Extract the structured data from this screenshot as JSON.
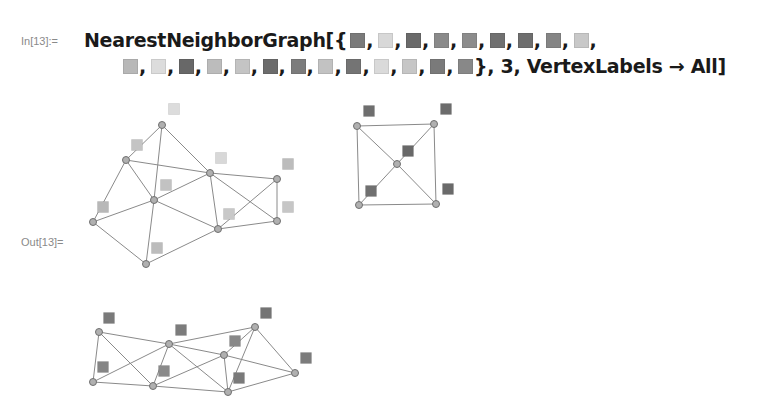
{
  "notebook": {
    "input_label": "In[13]:=",
    "output_label": "Out[13]=",
    "input": {
      "function": "NearestNeighborGraph[{",
      "swatches_row1": [
        "#7a7a7a",
        "#d8d8d8",
        "#6a6a6a",
        "#8a8a8a",
        "#8c8c8c",
        "#707070",
        "#6e6e6e",
        "#858585",
        "#c8c8c8"
      ],
      "swatches_row2": [
        "#b8b8b8",
        "#dcdcdc",
        "#686868",
        "#bcbcbc",
        "#c4c4c4",
        "#6c6c6c",
        "#7c7c7c",
        "#c2c2c2",
        "#747474",
        "#dadada",
        "#c6c6c6",
        "#7a7a7a",
        "#888888"
      ],
      "tail": "}, 3, VertexLabels → All]",
      "separator": ","
    },
    "output": {
      "graphs": [
        {
          "nodes": [
            {
              "id": "A",
              "x": 162,
              "y": 125,
              "label_color": "#dcdcdc",
              "lx": 174,
              "ly": 109
            },
            {
              "id": "B",
              "x": 126,
              "y": 160,
              "label_color": "#c4c4c4",
              "lx": 137,
              "ly": 145
            },
            {
              "id": "C",
              "x": 210,
              "y": 173,
              "label_color": "#d8d8d8",
              "lx": 221,
              "ly": 158
            },
            {
              "id": "D",
              "x": 277,
              "y": 179,
              "label_color": "#bcbcbc",
              "lx": 288,
              "ly": 164
            },
            {
              "id": "E",
              "x": 154,
              "y": 200,
              "label_color": "#c2c2c2",
              "lx": 166,
              "ly": 185
            },
            {
              "id": "F",
              "x": 93,
              "y": 222,
              "label_color": "#b8b8b8",
              "lx": 103,
              "ly": 207
            },
            {
              "id": "G",
              "x": 218,
              "y": 229,
              "label_color": "#c8c8c8",
              "lx": 229,
              "ly": 214
            },
            {
              "id": "H",
              "x": 277,
              "y": 221,
              "label_color": "#c6c6c6",
              "lx": 288,
              "ly": 207
            },
            {
              "id": "I",
              "x": 146,
              "y": 264,
              "label_color": "#bcbcbc",
              "lx": 157,
              "ly": 248
            }
          ],
          "edges": [
            [
              "A",
              "B"
            ],
            [
              "A",
              "E"
            ],
            [
              "A",
              "C"
            ],
            [
              "B",
              "C"
            ],
            [
              "B",
              "E"
            ],
            [
              "B",
              "F"
            ],
            [
              "E",
              "C"
            ],
            [
              "E",
              "F"
            ],
            [
              "E",
              "G"
            ],
            [
              "E",
              "I"
            ],
            [
              "F",
              "I"
            ],
            [
              "I",
              "G"
            ],
            [
              "C",
              "G"
            ],
            [
              "C",
              "D"
            ],
            [
              "C",
              "H"
            ],
            [
              "G",
              "D"
            ],
            [
              "G",
              "H"
            ],
            [
              "D",
              "H"
            ]
          ]
        },
        {
          "nodes": [
            {
              "id": "TL",
              "x": 357,
              "y": 126,
              "label_color": "#6e6e6e",
              "lx": 369,
              "ly": 111
            },
            {
              "id": "TR",
              "x": 434,
              "y": 124,
              "label_color": "#6c6c6c",
              "lx": 446,
              "ly": 109
            },
            {
              "id": "M",
              "x": 397,
              "y": 164,
              "label_color": "#686868",
              "lx": 408,
              "ly": 151
            },
            {
              "id": "BL",
              "x": 359,
              "y": 205,
              "label_color": "#707070",
              "lx": 371,
              "ly": 191
            },
            {
              "id": "BR",
              "x": 436,
              "y": 204,
              "label_color": "#6a6a6a",
              "lx": 448,
              "ly": 189
            }
          ],
          "edges": [
            [
              "TL",
              "TR"
            ],
            [
              "TL",
              "BL"
            ],
            [
              "TR",
              "BR"
            ],
            [
              "BL",
              "BR"
            ],
            [
              "TL",
              "M"
            ],
            [
              "TR",
              "M"
            ],
            [
              "BL",
              "M"
            ],
            [
              "BR",
              "M"
            ]
          ]
        },
        {
          "nodes": [
            {
              "id": "P1",
              "x": 99,
              "y": 332,
              "label_color": "#7a7a7a",
              "lx": 109,
              "ly": 318
            },
            {
              "id": "P2",
              "x": 169,
              "y": 344,
              "label_color": "#7c7c7c",
              "lx": 181,
              "ly": 330
            },
            {
              "id": "P3",
              "x": 255,
              "y": 327,
              "label_color": "#747474",
              "lx": 266,
              "ly": 313
            },
            {
              "id": "P4",
              "x": 224,
              "y": 355,
              "label_color": "#888888",
              "lx": 235,
              "ly": 341
            },
            {
              "id": "P5",
              "x": 93,
              "y": 382,
              "label_color": "#858585",
              "lx": 103,
              "ly": 367
            },
            {
              "id": "P6",
              "x": 153,
              "y": 386,
              "label_color": "#8a8a8a",
              "lx": 164,
              "ly": 371
            },
            {
              "id": "P7",
              "x": 228,
              "y": 392,
              "label_color": "#7a7a7a",
              "lx": 239,
              "ly": 378
            },
            {
              "id": "P8",
              "x": 295,
              "y": 373,
              "label_color": "#7c7c7c",
              "lx": 306,
              "ly": 358
            }
          ],
          "edges": [
            [
              "P1",
              "P2"
            ],
            [
              "P1",
              "P5"
            ],
            [
              "P1",
              "P6"
            ],
            [
              "P5",
              "P2"
            ],
            [
              "P5",
              "P6"
            ],
            [
              "P2",
              "P6"
            ],
            [
              "P2",
              "P3"
            ],
            [
              "P2",
              "P4"
            ],
            [
              "P2",
              "P7"
            ],
            [
              "P6",
              "P4"
            ],
            [
              "P6",
              "P7"
            ],
            [
              "P4",
              "P3"
            ],
            [
              "P4",
              "P7"
            ],
            [
              "P4",
              "P8"
            ],
            [
              "P3",
              "P7"
            ],
            [
              "P3",
              "P8"
            ],
            [
              "P7",
              "P8"
            ]
          ]
        }
      ],
      "style": {
        "edge_color": "#8a8a8a",
        "node_fill": "#b0b0b0",
        "node_stroke": "#707070",
        "node_radius": 3.5,
        "label_size": 11
      }
    }
  }
}
